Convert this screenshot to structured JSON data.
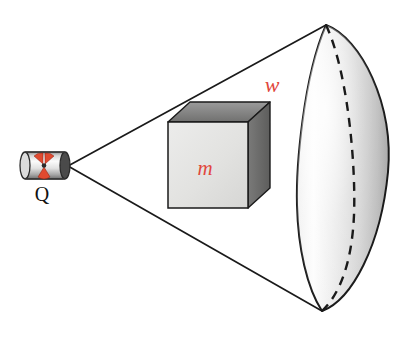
{
  "diagram": {
    "background_color": "#ffffff",
    "line_color": "#1a1a1a",
    "label_color_red": "#e1473c",
    "label_color_black": "#111111"
  },
  "source": {
    "name": "radioactive-source-capsule",
    "label": "Q",
    "label_position": {
      "x": 42,
      "y": 200
    },
    "body": {
      "x": 22,
      "y": 151,
      "width": 46,
      "height": 28,
      "fill_light": "#f2f2f2",
      "fill_mid": "#b9b9b9",
      "fill_dark": "#6a6a6a"
    },
    "trefoil": {
      "name": "radiation-trefoil-icon",
      "color": "#e04a30",
      "blades": 3
    },
    "apex": {
      "x": 68,
      "y": 166
    }
  },
  "cone": {
    "name": "radiation-cone",
    "apex": {
      "x": 68,
      "y": 166
    },
    "top_edge_end": {
      "x": 326,
      "y": 25
    },
    "bottom_edge_end": {
      "x": 322,
      "y": 311
    },
    "stroke_width": 1.6
  },
  "absorber": {
    "name": "absorber-cube",
    "label": "m",
    "label_position": {
      "x": 205,
      "y": 168
    },
    "front_face": {
      "x": 168,
      "y": 122,
      "width": 80,
      "height": 86,
      "fill": "#e3e3e0"
    },
    "top_face_fill": "#8e8e8e",
    "right_face_fill": "#6d6d6d",
    "depth_x": 22,
    "depth_y": -20,
    "stroke": "#1a1a1a"
  },
  "detector": {
    "name": "spherical-cap-detector",
    "label": "w",
    "label_position": {
      "x": 272,
      "y": 86
    },
    "cap_left_x": 297,
    "cap_right_x": 389,
    "cap_top": {
      "x": 326,
      "y": 25
    },
    "cap_bottom": {
      "x": 322,
      "y": 311
    },
    "fill_light": "#fbfbfb",
    "fill_mid": "#dedede",
    "fill_dark": "#b0b0b0",
    "dashed_arc": {
      "name": "hidden-meridian-dashed-arc",
      "color": "#1a1a1a",
      "dash_pattern": "9 7",
      "stroke_width": 2.4
    }
  },
  "labels": {
    "source_charge": "Q",
    "absorber_mass": "m",
    "detector_area": "w"
  }
}
